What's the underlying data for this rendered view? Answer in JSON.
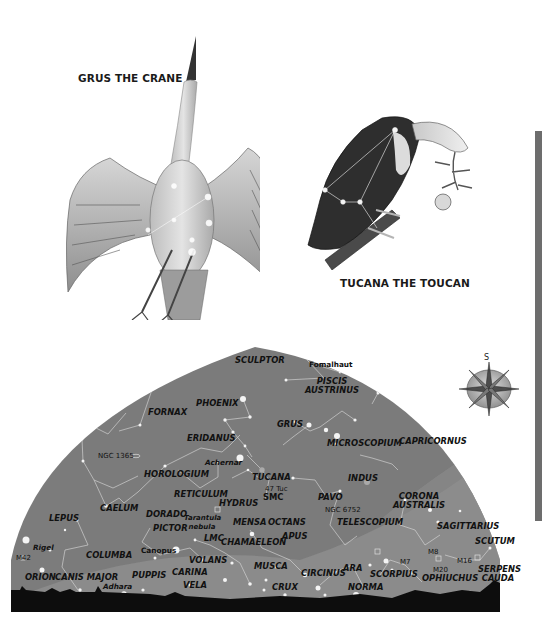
{
  "captions": {
    "grus": "GRUS THE CRANE",
    "tucana": "TUCANA THE TOUCAN"
  },
  "compass": {
    "direction_label": "S",
    "icon": "compass-rose-icon"
  },
  "colors": {
    "sky": "#7c7c7c",
    "milky_way": "#929292",
    "horizon": "#0d0d0d",
    "constellation_lines": "#d8d8d8",
    "stars": "#f4f4f4",
    "side_bar": "#6d6d6d"
  },
  "constellations": [
    {
      "name": "SCULPTOR"
    },
    {
      "name": "PISCIS AUSTRINUS"
    },
    {
      "name": "FORNAX"
    },
    {
      "name": "PHOENIX"
    },
    {
      "name": "GRUS"
    },
    {
      "name": "ERIDANUS"
    },
    {
      "name": "MICROSCOPIUM"
    },
    {
      "name": "CAPRICORNUS"
    },
    {
      "name": "HOROLOGIUM"
    },
    {
      "name": "TUCANA"
    },
    {
      "name": "INDUS"
    },
    {
      "name": "RETICULUM"
    },
    {
      "name": "HYDRUS"
    },
    {
      "name": "PAVO"
    },
    {
      "name": "CORONA AUSTRALIS"
    },
    {
      "name": "LEPUS"
    },
    {
      "name": "CAELUM"
    },
    {
      "name": "DORADO"
    },
    {
      "name": "MENSA"
    },
    {
      "name": "OCTANS"
    },
    {
      "name": "TELESCOPIUM"
    },
    {
      "name": "PICTOR"
    },
    {
      "name": "CHAMAELEON"
    },
    {
      "name": "APUS"
    },
    {
      "name": "SAGITTARIUS"
    },
    {
      "name": "SCUTUM"
    },
    {
      "name": "COLUMBA"
    },
    {
      "name": "VOLANS"
    },
    {
      "name": "MUSCA"
    },
    {
      "name": "CARINA"
    },
    {
      "name": "PUPPIS"
    },
    {
      "name": "ORION"
    },
    {
      "name": "CANIS MAJOR"
    },
    {
      "name": "VELA"
    },
    {
      "name": "CRUX"
    },
    {
      "name": "CIRCINUS"
    },
    {
      "name": "ARA"
    },
    {
      "name": "SCORPIUS"
    },
    {
      "name": "NORMA"
    },
    {
      "name": "OPHIUCHUS"
    },
    {
      "name": "SERPENS CAUDA"
    }
  ],
  "stars": [
    {
      "name": "Fomalhaut"
    },
    {
      "name": "Achernar"
    },
    {
      "name": "Canopus"
    },
    {
      "name": "Rigel"
    },
    {
      "name": "Adhara"
    }
  ],
  "deep_sky": [
    {
      "name": "NGC 1365"
    },
    {
      "name": "47 Tuc"
    },
    {
      "name": "SMC"
    },
    {
      "name": "NGC 6752"
    },
    {
      "name": "Tarantula nebula"
    },
    {
      "name": "LMC"
    },
    {
      "name": "M42"
    },
    {
      "name": "M7"
    },
    {
      "name": "M8"
    },
    {
      "name": "M20"
    },
    {
      "name": "M16"
    }
  ]
}
